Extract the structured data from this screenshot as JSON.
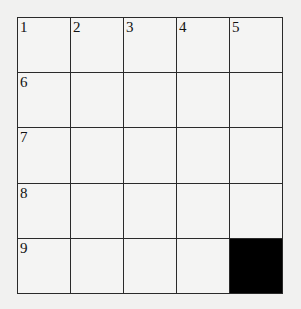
{
  "puzzle": {
    "rows": 5,
    "cols": 5,
    "cells": [
      [
        {
          "num": "1",
          "block": false
        },
        {
          "num": "2",
          "block": false
        },
        {
          "num": "3",
          "block": false
        },
        {
          "num": "4",
          "block": false
        },
        {
          "num": "5",
          "block": false
        }
      ],
      [
        {
          "num": "6",
          "block": false
        },
        {
          "num": "",
          "block": false
        },
        {
          "num": "",
          "block": false
        },
        {
          "num": "",
          "block": false
        },
        {
          "num": "",
          "block": false
        }
      ],
      [
        {
          "num": "7",
          "block": false
        },
        {
          "num": "",
          "block": false
        },
        {
          "num": "",
          "block": false
        },
        {
          "num": "",
          "block": false
        },
        {
          "num": "",
          "block": false
        }
      ],
      [
        {
          "num": "8",
          "block": false
        },
        {
          "num": "",
          "block": false
        },
        {
          "num": "",
          "block": false
        },
        {
          "num": "",
          "block": false
        },
        {
          "num": "",
          "block": false
        }
      ],
      [
        {
          "num": "9",
          "block": false
        },
        {
          "num": "",
          "block": false
        },
        {
          "num": "",
          "block": false
        },
        {
          "num": "",
          "block": false
        },
        {
          "num": "",
          "block": true
        }
      ]
    ]
  },
  "colors": {
    "grid_line": "#2a2a2a",
    "block": "#000000",
    "paper": "#f1f1f0"
  }
}
